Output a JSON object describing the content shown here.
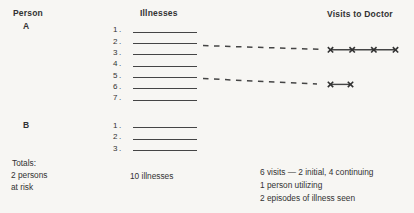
{
  "headers": {
    "person": "Person",
    "illnesses": "Illnesses",
    "visits_to_doctor": "Visits to Doctor"
  },
  "persons": [
    {
      "label": "A",
      "illness_numbers": [
        "1.",
        "2.",
        "3.",
        "4.",
        "5.",
        "6.",
        "7."
      ]
    },
    {
      "label": "B",
      "illness_numbers": [
        "1.",
        "2.",
        "3."
      ]
    }
  ],
  "visit_rows": [
    {
      "person": "A",
      "illness_number": "2.",
      "visit_marks": 4
    },
    {
      "person": "A",
      "illness_number": "5.",
      "visit_marks": 2
    }
  ],
  "icons": {
    "visit_mark": "×"
  },
  "totals": {
    "heading": "Totals:",
    "persons": [
      "2 persons",
      "at risk"
    ],
    "illnesses": "10 illnesses",
    "visits": [
      "6 visits — 2 initial, 4 continuing",
      "1 person utilizing",
      "2 episodes of illness seen"
    ]
  },
  "colors": {
    "background": "#f7f6f3",
    "ink": "#323232",
    "line": "#454545"
  }
}
